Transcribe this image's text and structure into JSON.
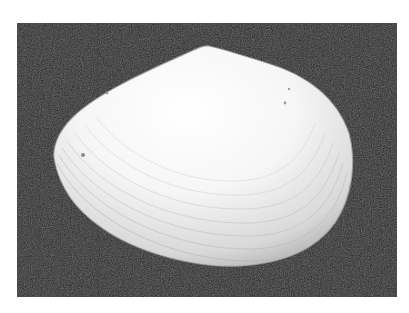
{
  "image": {
    "subject": "clam shell",
    "background_color": "#1e1e1e",
    "frame_color": "#ffffff",
    "shell_color": "#f4f4f4",
    "shell_shadow_color": "#bdbdbd"
  }
}
